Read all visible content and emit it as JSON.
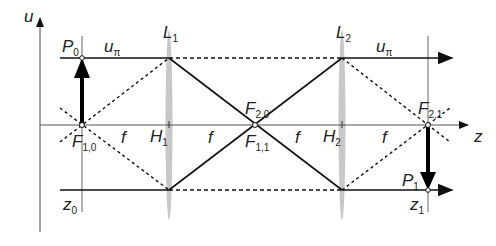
{
  "diagram": {
    "axes": {
      "vertical": "u",
      "horizontal": "z"
    },
    "lenses": [
      {
        "name": "L",
        "sub": "1",
        "principal": "H",
        "principal_sub": "1"
      },
      {
        "name": "L",
        "sub": "2",
        "principal": "H",
        "principal_sub": "2"
      }
    ],
    "planes": [
      {
        "name": "P",
        "sub": "0",
        "z": "z",
        "z_sub": "0"
      },
      {
        "name": "P",
        "sub": "1",
        "z": "z",
        "z_sub": "1"
      }
    ],
    "foci": [
      {
        "name": "F",
        "sub": "1,0"
      },
      {
        "name": "F",
        "sub": "2,0"
      },
      {
        "name": "F",
        "sub": "1,1"
      },
      {
        "name": "F",
        "sub": "2,1"
      }
    ],
    "beam_labels": [
      {
        "name": "u",
        "sub": "π"
      },
      {
        "name": "u",
        "sub": "π"
      }
    ],
    "focal_length": "f",
    "colors": {
      "line": "#111111",
      "axis": "#555555",
      "lens": "#bbbbbb"
    }
  }
}
